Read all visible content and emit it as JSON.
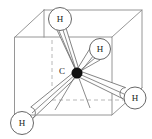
{
  "figure": {
    "name": "methane-tetrahedral-in-cube",
    "background_color": "#ffffff",
    "width": 152,
    "height": 139
  },
  "molecule": {
    "center_atom": {
      "symbol": "C",
      "label": "C",
      "label_x": 62,
      "label_y": 72,
      "x": 77,
      "y": 73,
      "radius": 5.2,
      "color": "#111111"
    },
    "hydrogens": [
      {
        "id": "h-top",
        "symbol": "H",
        "label": "H",
        "x": 60,
        "y": 19,
        "radius": 11.5,
        "color": "#ffffff",
        "stroke": "#5f5f5f"
      },
      {
        "id": "h-upper-right",
        "symbol": "H",
        "label": "H",
        "x": 100,
        "y": 49,
        "radius": 10.5,
        "color": "#ffffff",
        "stroke": "#5f5f5f"
      },
      {
        "id": "h-lower-right",
        "symbol": "H",
        "label": "H",
        "x": 135,
        "y": 98,
        "radius": 11,
        "color": "#ffffff",
        "stroke": "#5f5f5f"
      },
      {
        "id": "h-lower-left",
        "symbol": "H",
        "label": "H",
        "x": 22,
        "y": 123,
        "radius": 11.5,
        "color": "#ffffff",
        "stroke": "#5f5f5f"
      }
    ],
    "bonds": [
      {
        "id": "bond-c-h-top",
        "from": "C",
        "to": "h-top",
        "style": "tapered"
      },
      {
        "id": "bond-c-h-upper-right",
        "from": "C",
        "to": "h-upper-right",
        "style": "tapered"
      },
      {
        "id": "bond-c-h-lower-right",
        "from": "C",
        "to": "h-lower-right",
        "style": "tapered"
      },
      {
        "id": "bond-c-h-lower-left",
        "from": "C",
        "to": "h-lower-left",
        "style": "tapered"
      }
    ]
  },
  "cube": {
    "stroke_color": "#8a8a8a",
    "hidden_stroke_color": "#b0b0b0",
    "front_face": {
      "left": 15,
      "right": 112,
      "top": 37,
      "bottom": 115
    },
    "depth_offset": {
      "dx": 29,
      "dy": -27
    },
    "hidden_vertex": {
      "x": 52,
      "y": 100
    }
  },
  "guides": {
    "vertical_dashed": {
      "x": 52,
      "y1": 40,
      "y2": 100
    },
    "horizontal_dashed": {
      "x1": 52,
      "y1": 100,
      "x2": 125,
      "y2": 100
    }
  }
}
